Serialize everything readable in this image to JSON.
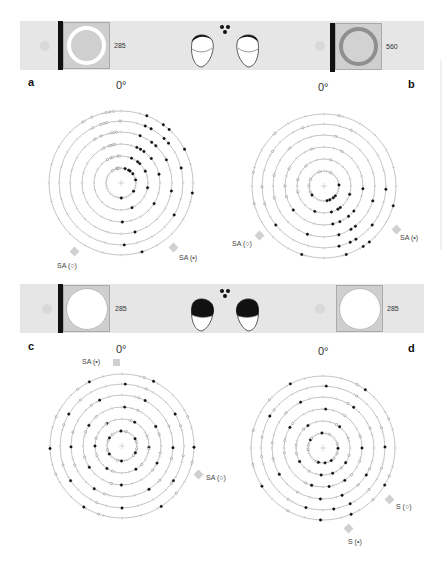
{
  "panels": [
    {
      "id": "a",
      "letter": "a",
      "zero_label": "0°",
      "stimulus": {
        "wavelength": "285",
        "style": "ring-white",
        "bar": true
      },
      "markers": [
        {
          "label": "SA (○)",
          "angle_deg": 225
        },
        {
          "label": "SA (•)",
          "angle_deg": 135
        }
      ]
    },
    {
      "id": "b",
      "letter": "b",
      "zero_label": "0°",
      "stimulus": {
        "wavelength": "560",
        "style": "ring-dark",
        "bar": true
      },
      "markers": [
        {
          "label": "SA (○)",
          "angle_deg": 240
        },
        {
          "label": "SA (•)",
          "angle_deg": 120
        }
      ]
    },
    {
      "id": "c",
      "letter": "c",
      "zero_label": "0°",
      "stimulus": {
        "wavelength": "285",
        "style": "disc-white",
        "bar": true
      },
      "markers": [
        {
          "label": "SA (•)",
          "angle_deg": 350
        },
        {
          "label": "SA (○)",
          "angle_deg": 110
        }
      ]
    },
    {
      "id": "d",
      "letter": "d",
      "zero_label": "0°",
      "stimulus": {
        "wavelength": "285",
        "style": "disc-white",
        "bar": false
      },
      "markers": [
        {
          "label": "S (○)",
          "angle_deg": 135
        },
        {
          "label": "S (•)",
          "angle_deg": 165
        }
      ]
    }
  ],
  "eyes_top": {
    "state": "dorsal-dark-small"
  },
  "eyes_bottom": {
    "state": "dorsal-dark-large"
  },
  "chart_data": [
    {
      "type": "scatter",
      "title": "a — polar orientation plot, stimulus 285 nm (white ring)",
      "coordinate_system": "polar",
      "angle_zero": "0° at top",
      "rings": 6,
      "legend": [
        "SA (○) open symbols",
        "SA (•) filled symbols"
      ],
      "series": [
        {
          "name": "filled (•)",
          "angles_deg": [
            20,
            25,
            30,
            35,
            40,
            45,
            50,
            60,
            80,
            100,
            120,
            160,
            180
          ],
          "concentration": "strongly clustered 20°–50°"
        },
        {
          "name": "open (○)",
          "angles_deg": [
            330,
            340,
            345,
            350,
            355
          ],
          "concentration": "clustered 330°–355°"
        }
      ]
    },
    {
      "type": "scatter",
      "title": "b — polar orientation plot, stimulus 560 nm (dark ring)",
      "coordinate_system": "polar",
      "angle_zero": "0° at top",
      "rings": 6,
      "legend": [
        "SA (○) open symbols",
        "SA (•) filled symbols"
      ],
      "series": [
        {
          "name": "filled (•)",
          "angles_deg": [
            90,
            110,
            130,
            140,
            145,
            150,
            155,
            160,
            170,
            200,
            230
          ],
          "concentration": "strongly clustered 140°–160°"
        },
        {
          "name": "open (○)",
          "angles_deg": [
            250,
            260,
            270,
            280,
            300,
            320,
            340,
            10,
            30
          ],
          "concentration": "spread 250°–30°"
        }
      ]
    },
    {
      "type": "scatter",
      "title": "c — polar orientation plot, stimulus 285 nm (white disc)",
      "coordinate_system": "polar",
      "angle_zero": "0° at top",
      "rings": 6,
      "legend": [
        "SA (•) filled symbols",
        "SA (○) open symbols"
      ],
      "series": [
        {
          "name": "filled (•)",
          "angles_deg": [
            0,
            30,
            60,
            90,
            120,
            150,
            180,
            210,
            240,
            270,
            300,
            330
          ],
          "concentration": "roughly uniform"
        },
        {
          "name": "open (○)",
          "angles_deg": [
            20,
            70,
            100,
            130,
            200,
            250,
            290,
            320
          ],
          "concentration": "roughly uniform"
        }
      ]
    },
    {
      "type": "scatter",
      "title": "d — polar orientation plot, stimulus 285 nm (white disc, no bar)",
      "coordinate_system": "polar",
      "angle_zero": "0° at top",
      "rings": 6,
      "legend": [
        "S (○) open symbols",
        "S (•) filled symbols"
      ],
      "series": [
        {
          "name": "filled (•)",
          "angles_deg": [
            0,
            40,
            90,
            120,
            150,
            160,
            170,
            180,
            200,
            240,
            300,
            330
          ],
          "concentration": "mild cluster near 160°–180°"
        },
        {
          "name": "open (○)",
          "angles_deg": [
            30,
            70,
            110,
            135,
            210,
            260,
            280,
            310
          ],
          "concentration": "roughly uniform"
        }
      ]
    }
  ]
}
